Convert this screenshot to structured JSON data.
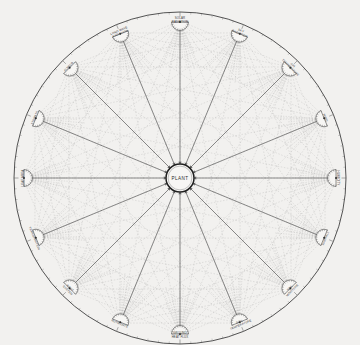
{
  "figure": {
    "hub_label": "PLANT",
    "paper_color": "#f2f1ef",
    "ink_color": "#3a3a3a",
    "spoke_color": "#555555",
    "web_color": "#8d8d8d",
    "rim_color": "#4a4a4a",
    "circle": {
      "cx": 180,
      "cy": 178,
      "r": 166,
      "hub_r": 14
    },
    "nodes": [
      {
        "index": 0,
        "angle": -90,
        "label": "SOLAR\nRADIATION"
      },
      {
        "index": 1,
        "angle": -67.5,
        "label": "SKY\nRADIATION"
      },
      {
        "index": 2,
        "angle": -45,
        "label": "AIR\nTEMPERATURE"
      },
      {
        "index": 3,
        "angle": -22.5,
        "label": "WIND"
      },
      {
        "index": 4,
        "angle": 0,
        "label": "HUMIDITY"
      },
      {
        "index": 5,
        "angle": 22.5,
        "label": "RAINFALL"
      },
      {
        "index": 6,
        "angle": 45,
        "label": "SOIL\nMOISTURE"
      },
      {
        "index": 7,
        "angle": 67.5,
        "label": "SOIL\nTEMPERATURE"
      },
      {
        "index": 8,
        "angle": 90,
        "label": "GROUND\nHEAT FLUX"
      },
      {
        "index": 9,
        "angle": 112.5,
        "label": "NUTRIENTS"
      },
      {
        "index": 10,
        "angle": 135,
        "label": "ROOT\nSYSTEM"
      },
      {
        "index": 11,
        "angle": 157.5,
        "label": "TRANSPIRATION"
      },
      {
        "index": 12,
        "angle": 180,
        "label": "LEAF AREA"
      },
      {
        "index": 13,
        "angle": -157.5,
        "label": "STOMATA"
      },
      {
        "index": 14,
        "angle": -135,
        "label": "ALBEDO"
      },
      {
        "index": 15,
        "angle": -112.5,
        "label": "LONG WAVE\nRADIATION"
      }
    ],
    "node_count": 16,
    "rim_tick_count": 96,
    "fan_rays_per_node": 13
  }
}
